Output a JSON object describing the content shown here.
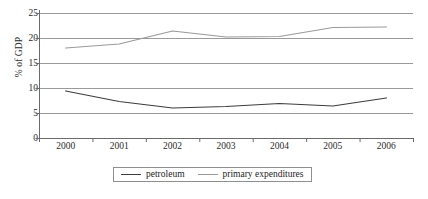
{
  "chart_data": {
    "type": "line",
    "title": "",
    "xlabel": "",
    "ylabel": "% of GDP",
    "categories": [
      "2000",
      "2001",
      "2002",
      "2003",
      "2004",
      "2005",
      "2006"
    ],
    "x": [
      2000,
      2001,
      2002,
      2003,
      2004,
      2005,
      2006
    ],
    "ylim": [
      0,
      25
    ],
    "yticks": [
      0,
      5,
      10,
      15,
      20,
      25
    ],
    "ytick_labels": [
      "0",
      "5",
      "10",
      "15",
      "20",
      "25"
    ],
    "grid": "horizontal",
    "legend_position": "bottom-center",
    "series": [
      {
        "name": "petroleum",
        "color": "#3d3d3d",
        "values": [
          9.4,
          7.3,
          6.0,
          6.3,
          6.9,
          6.4,
          8.0
        ]
      },
      {
        "name": "primary expenditures",
        "color": "#9a9a9a",
        "values": [
          18.0,
          18.8,
          21.4,
          20.2,
          20.3,
          22.1,
          22.2
        ]
      }
    ]
  },
  "legend": {
    "items": [
      {
        "label": "petroleum",
        "color": "#3d3d3d"
      },
      {
        "label": "primary expenditures",
        "color": "#9a9a9a"
      }
    ]
  },
  "axes": {
    "y_title": "% of GDP",
    "axis_color": "#6b6b6b",
    "grid_color": "#9a9a9a"
  }
}
